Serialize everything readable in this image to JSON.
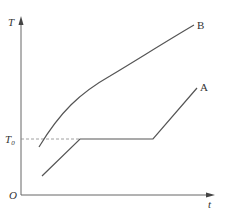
{
  "diagram": {
    "y_axis_label": "T",
    "x_axis_label": "t",
    "origin_label": "O",
    "reference_level": {
      "label": "T",
      "subscript": "0",
      "description": "T0 dashed reference line"
    },
    "curves": [
      {
        "name": "A",
        "label": "A",
        "description": "heats linearly to T0, plateau at T0, then rises linearly again"
      },
      {
        "name": "B",
        "label": "B",
        "description": "rises continuously, concave, no plateau"
      }
    ],
    "colors": {
      "line": "#555555",
      "axis": "#666666",
      "dashed": "#888888"
    }
  }
}
